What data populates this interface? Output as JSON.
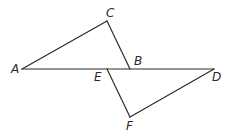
{
  "diagram": {
    "type": "geometry",
    "points": {
      "A": {
        "label": "A",
        "x": 22,
        "y": 69,
        "label_x": 11,
        "label_y": 73
      },
      "B": {
        "label": "B",
        "x": 130,
        "y": 69,
        "label_x": 134,
        "label_y": 65
      },
      "C": {
        "label": "C",
        "x": 107,
        "y": 21,
        "label_x": 106,
        "label_y": 17
      },
      "D": {
        "label": "D",
        "x": 214,
        "y": 69,
        "label_x": 212,
        "label_y": 81
      },
      "E": {
        "label": "E",
        "x": 107,
        "y": 69,
        "label_x": 94,
        "label_y": 81
      },
      "F": {
        "label": "F",
        "x": 130,
        "y": 117,
        "label_x": 126,
        "label_y": 130
      }
    },
    "segments": [
      {
        "from": "A",
        "to": "D",
        "name": "segment-AD"
      },
      {
        "from": "A",
        "to": "C",
        "name": "segment-AC"
      },
      {
        "from": "C",
        "to": "B",
        "name": "segment-CB"
      },
      {
        "from": "E",
        "to": "F",
        "name": "segment-EF"
      },
      {
        "from": "F",
        "to": "D",
        "name": "segment-FD"
      }
    ],
    "stroke_color": "#2b2b2b"
  }
}
